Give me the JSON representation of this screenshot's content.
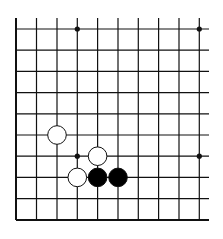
{
  "board": {
    "description": "Go board lower-left corner fragment, 10x10 visible grid",
    "columns": 10,
    "rows": 10,
    "edges": [
      "left",
      "bottom"
    ],
    "star_points": [
      [
        3,
        0
      ],
      [
        9,
        0
      ],
      [
        3,
        6
      ],
      [
        9,
        6
      ]
    ],
    "stones": [
      {
        "color": "white",
        "col": 2,
        "row": 5
      },
      {
        "color": "white",
        "col": 4,
        "row": 6
      },
      {
        "color": "white",
        "col": 3,
        "row": 7
      },
      {
        "color": "black",
        "col": 4,
        "row": 7
      },
      {
        "color": "black",
        "col": 5,
        "row": 7
      }
    ],
    "colors": {
      "line": "#111111",
      "black": "#000000",
      "white": "#ffffff",
      "background": "#ffffff"
    }
  }
}
